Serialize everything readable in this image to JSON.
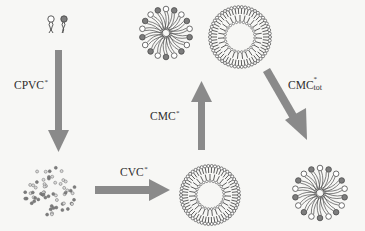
{
  "diagram": {
    "colors": {
      "background": "#f7f7f5",
      "arrow": "#8a8a8a",
      "line": "#4a4a4a",
      "head_dark": "#7d7d7d",
      "head_light": "#ffffff"
    },
    "nodes": [
      {
        "id": "monomers",
        "label": "surfactant monomers",
        "icon": "surfactant-monomer-icon"
      },
      {
        "id": "dispersed",
        "label": "dispersed molecules",
        "icon": "dispersed-dots-icon"
      },
      {
        "id": "vesicle-bottom",
        "label": "vesicle",
        "icon": "vesicle-icon"
      },
      {
        "id": "micelle-top",
        "label": "micelle",
        "icon": "micelle-icon"
      },
      {
        "id": "vesicle-top",
        "label": "vesicle",
        "icon": "vesicle-icon"
      },
      {
        "id": "micelle-bottom",
        "label": "micelle",
        "icon": "micelle-icon"
      }
    ],
    "edges": [
      {
        "from": "monomers",
        "to": "dispersed",
        "direction": "down",
        "label_main": "CPVC",
        "label_sup": "*",
        "label_sub": ""
      },
      {
        "from": "dispersed",
        "to": "vesicle-bottom",
        "direction": "right",
        "label_main": "CVC",
        "label_sup": "*",
        "label_sub": ""
      },
      {
        "from": "vesicle-bottom",
        "to": "micelle-top",
        "direction": "up",
        "label_main": "CMC",
        "label_sup": "*",
        "label_sub": ""
      },
      {
        "from": "vesicle-top",
        "to": "micelle-bottom",
        "direction": "down-right",
        "label_main": "CMC",
        "label_sup": "*",
        "label_sub": "tot"
      }
    ]
  }
}
